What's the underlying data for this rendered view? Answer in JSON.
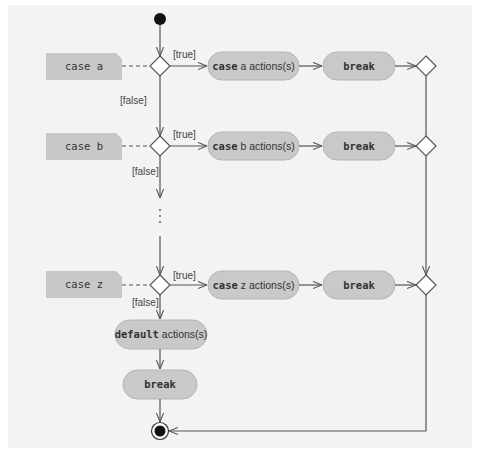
{
  "diagram": {
    "type": "UML activity diagram",
    "colors": {
      "note_fill": "#c8c8c8",
      "action_fill": "#c9c9c9",
      "action_stroke": "#b5b5b5",
      "line": "#555555",
      "panel": "#f3f3f3"
    },
    "cases": [
      {
        "note": "case a",
        "action_keyword": "case",
        "action_rest": " a actions(s)",
        "break_label": "break",
        "guard_true": "[true]",
        "guard_false": "[false]"
      },
      {
        "note": "case b",
        "action_keyword": "case",
        "action_rest": " b actions(s)",
        "break_label": "break",
        "guard_true": "[true]",
        "guard_false": "[false]"
      },
      {
        "note": "case z",
        "action_keyword": "case",
        "action_rest": " z actions(s)",
        "break_label": "break",
        "guard_true": "[true]",
        "guard_false": "[false]"
      }
    ],
    "ellipsis": "⋮",
    "default": {
      "action_keyword": "default",
      "action_rest": " actions(s)",
      "break_label": "break"
    }
  }
}
